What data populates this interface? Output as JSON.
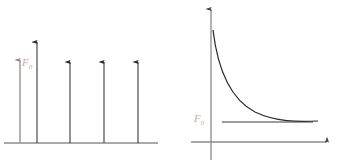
{
  "figure": {
    "background_color": "#ffffff",
    "axis_color": "#808080",
    "stem_color": "#3a3a3a",
    "curve_color": "#2b2b2b",
    "label_color": "#e8a090"
  },
  "left_panel": {
    "name": "discrete-force-impulses-plot",
    "label": "F",
    "label_subscript": "0",
    "baseline_y": 143,
    "baseline_x_start": 4,
    "baseline_x_end": 158,
    "arrows": [
      {
        "x": 20,
        "tip_y": 60,
        "color": "#9a9a9a"
      },
      {
        "x": 37,
        "tip_y": 42,
        "color": "#3a3a3a"
      },
      {
        "x": 70,
        "tip_y": 62,
        "color": "#3a3a3a"
      },
      {
        "x": 104,
        "tip_y": 62,
        "color": "#3a3a3a"
      },
      {
        "x": 138,
        "tip_y": 62,
        "color": "#3a3a3a"
      }
    ]
  },
  "right_panel": {
    "name": "decaying-force-curve-plot",
    "label": "F",
    "label_subscript": "0",
    "y_axis_x": 211,
    "y_axis_top_y": 9,
    "y_axis_bottom_y": 160,
    "x_axis_y": 142,
    "x_axis_start_x": 191,
    "x_axis_end_x": 327,
    "curve_start": [
      213,
      30
    ],
    "curve_end": [
      318,
      121
    ],
    "asymptote_y": 122,
    "asymptote_x_start": 222,
    "asymptote_x_end": 313
  }
}
